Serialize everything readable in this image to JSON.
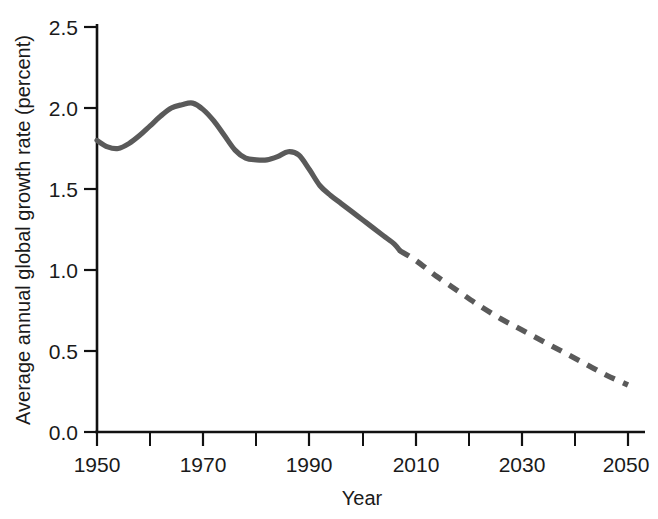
{
  "chart_data": {
    "type": "line",
    "title": "",
    "xlabel": "Year",
    "ylabel": "Average annual global growth rate (percent)",
    "xlim": [
      1950,
      2050
    ],
    "ylim": [
      0.0,
      2.5
    ],
    "grid": false,
    "legend": null,
    "x_ticks": [
      1950,
      1970,
      1990,
      2010,
      2030,
      2050
    ],
    "x_tick_labels": [
      "1950",
      "1970",
      "1990",
      "2010",
      "2030",
      "2050"
    ],
    "x_minor_ticks": [
      1960,
      1980,
      2000,
      2020,
      2040
    ],
    "y_ticks": [
      0.0,
      0.5,
      1.0,
      1.5,
      2.0,
      2.5
    ],
    "y_tick_labels": [
      "0.0",
      "0.5",
      "1.0",
      "1.5",
      "2.0",
      "2.5"
    ],
    "line_color": "#5a5a5a",
    "axis_color": "#111111",
    "series": [
      {
        "name": "Estimated",
        "style": "solid",
        "x": [
          1950,
          1952,
          1954,
          1956,
          1958,
          1960,
          1962,
          1964,
          1966,
          1968,
          1970,
          1972,
          1974,
          1976,
          1978,
          1980,
          1982,
          1984,
          1986,
          1988,
          1990,
          1992,
          1994,
          1996,
          1998,
          2000,
          2002,
          2004,
          2006,
          2007
        ],
        "values": [
          1.8,
          1.76,
          1.75,
          1.78,
          1.83,
          1.89,
          1.95,
          2.0,
          2.02,
          2.03,
          1.99,
          1.92,
          1.83,
          1.74,
          1.69,
          1.68,
          1.68,
          1.7,
          1.73,
          1.71,
          1.62,
          1.52,
          1.46,
          1.41,
          1.36,
          1.31,
          1.26,
          1.21,
          1.16,
          1.12
        ]
      },
      {
        "name": "Projected",
        "style": "dashed",
        "x": [
          2007,
          2010,
          2014,
          2018,
          2022,
          2026,
          2030,
          2034,
          2038,
          2042,
          2046,
          2050
        ],
        "values": [
          1.12,
          1.06,
          0.96,
          0.87,
          0.78,
          0.7,
          0.63,
          0.56,
          0.49,
          0.42,
          0.35,
          0.29
        ]
      }
    ]
  }
}
